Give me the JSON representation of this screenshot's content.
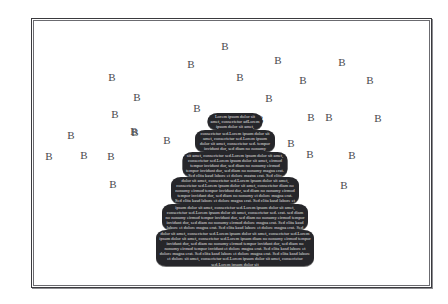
{
  "figure": {
    "background_color": "#ffffff",
    "frame_color": "#3a3a3e",
    "pyramid_fill": "#27272b",
    "pyramid_text_color": "#f2f2f2",
    "label_color": "#4a4a4e"
  },
  "chart_data": {
    "type": "bar",
    "title": "",
    "subtitle": "",
    "xlabel": "",
    "ylabel": "",
    "grid": false,
    "legend": "none",
    "orientation": "horizontal-centered-pyramid",
    "categories": [
      "tier-1",
      "tier-2",
      "tier-3",
      "tier-4",
      "tier-5",
      "tier-6"
    ],
    "values": [
      55,
      80,
      105,
      128,
      146,
      158
    ],
    "ylim": [
      0,
      160
    ],
    "annotations": {
      "scatter_label": "B",
      "scatter_count": 28
    }
  },
  "pyramid": {
    "tiers": [
      {
        "index": 1,
        "center_x": 234,
        "top": 112,
        "width": 55,
        "height": 17,
        "text": "Lorem ipsum dolor sit amet, consectetur adLorem ipsum dolor sit amet, consectetur ad no nonumy eirmod tempor invidunt dolore magna erat. Sed diam no nonumy eirmod tempor invidunt dolore magna erat. Sed diam no nonumy eirmod tempor invidunt dolore magna erat. Sed clita kasd"
      },
      {
        "index": 2,
        "center_x": 234,
        "top": 129,
        "width": 80,
        "height": 22,
        "text": "consectetur sed.Lorem ipsum dolor sit amet, consectetur sed.Lorem ipsum dolor sit amet, consectetur sed. tempor invidunt dor, sed diam no nonumy eirmod tempor invidunt dor, sed diam no nonumy eirmod erat. Sed clita kasd labore et dolore magna aliquyam erat. Sed clita kasd labore et"
      },
      {
        "index": 3,
        "center_x": 234,
        "top": 151,
        "width": 105,
        "height": 25,
        "text": "sit amet, consectetur sed.Lorem ipsum dolor sit amet, consectetur sed.Lorem ipsum dolor sit amet, eirmod tempor invidunt dor, sed diam no nonumy eirmod tempor invidunt dor, sed diam no nonumy magna erat. Sed clita kasd labore et dolore magna erat. Sed clita kasd labore et dolore magna"
      },
      {
        "index": 4,
        "center_x": 234,
        "top": 176,
        "width": 128,
        "height": 27,
        "text": "dolor sit amet, consectetur sed.Lorem ipsum dolor sit amet, consectetur sed.Lorem ipsum dolor sit amet, consectetur diam no nonumy eirmod tempor invidunt dor, sed diam no nonumy eirmod tempor invidunt dor, sed diam no nonumy et dolore magna erat. Sed clita kasd labore et dolore magna erat. Sed clita kasd labore et dolore magna"
      },
      {
        "index": 5,
        "center_x": 234,
        "top": 203,
        "width": 146,
        "height": 26,
        "text": "ipsum dolor sit amet, consectetur sed.Lorem ipsum dolor sit amet, consectetur sed.Lorem ipsum dolor sit amet, consectetur sed. erat. sed diam no nonumy eirmod tempor invidunt dor, sed diam no nonumy eirmod tempor invidunt dor, sed diam no nonumy eirmod dolore magna erat. Sed clita kasd labore et dolore magna erat. Sed clita kasd labore et dolore magna erat. Sed clita kasd"
      },
      {
        "index": 6,
        "center_x": 234,
        "top": 229,
        "width": 158,
        "height": 36,
        "text": "dolor sit amet, consectetur sed.Lorem ipsum dolor sit amet, consectetur sed.Lorem ipsum dolor sit amet, consectetur sed.Lorem ipsum diam no nonumy eirmod tempor invidunt dor, sed diam no nonumy eirmod tempor invidunt dor, sed diam no nonumy eirmod tempor invidunt et dolore magna erat. Sed clita kasd labore et dolore magna erat. Sed clita kasd labore et dolore magna erat. Sed clita kasd labore et dolore sit amet, consectetur sed.Lorem ipsum dolor sit amet, consectetur sed.Lorem ipsum dolor sit"
      }
    ]
  },
  "scatter_labels": [
    {
      "text": "B",
      "x": 224,
      "y": 45
    },
    {
      "text": "B",
      "x": 190,
      "y": 63
    },
    {
      "text": "B",
      "x": 277,
      "y": 59
    },
    {
      "text": "B",
      "x": 341,
      "y": 61
    },
    {
      "text": "B",
      "x": 111,
      "y": 76
    },
    {
      "text": "B",
      "x": 239,
      "y": 76
    },
    {
      "text": "B",
      "x": 302,
      "y": 79
    },
    {
      "text": "B",
      "x": 369,
      "y": 79
    },
    {
      "text": "B",
      "x": 136,
      "y": 96
    },
    {
      "text": "B",
      "x": 268,
      "y": 97
    },
    {
      "text": "B",
      "x": 114,
      "y": 113
    },
    {
      "text": "B",
      "x": 133,
      "y": 130
    },
    {
      "text": "B",
      "x": 310,
      "y": 116
    },
    {
      "text": "B",
      "x": 328,
      "y": 116
    },
    {
      "text": "B",
      "x": 377,
      "y": 117
    },
    {
      "text": "B",
      "x": 70,
      "y": 134
    },
    {
      "text": "B",
      "x": 134,
      "y": 131
    },
    {
      "text": "B",
      "x": 166,
      "y": 139
    },
    {
      "text": "B",
      "x": 290,
      "y": 142
    },
    {
      "text": "B",
      "x": 309,
      "y": 153
    },
    {
      "text": "B",
      "x": 351,
      "y": 154
    },
    {
      "text": "B",
      "x": 48,
      "y": 155
    },
    {
      "text": "B",
      "x": 83,
      "y": 154
    },
    {
      "text": "B",
      "x": 110,
      "y": 155
    },
    {
      "text": "B",
      "x": 112,
      "y": 183
    },
    {
      "text": "B",
      "x": 343,
      "y": 184
    },
    {
      "text": "B",
      "x": 259,
      "y": 118
    },
    {
      "text": "B",
      "x": 196,
      "y": 107
    }
  ]
}
